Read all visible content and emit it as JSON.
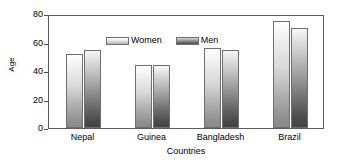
{
  "chart_data": {
    "type": "bar",
    "title": "",
    "xlabel": "Countries",
    "ylabel": "Age",
    "categories": [
      "Nepal",
      "Guinea",
      "Bangladesh",
      "Brazil"
    ],
    "series": [
      {
        "name": "Women",
        "values": [
          52,
          44,
          56,
          75
        ]
      },
      {
        "name": "Men",
        "values": [
          55,
          44,
          55,
          70
        ]
      }
    ],
    "ylim": [
      0,
      80
    ],
    "yticks": [
      0,
      20,
      40,
      60,
      80
    ],
    "ytick_labels": [
      "0",
      "20",
      "40",
      "60",
      "80"
    ],
    "grid": false,
    "legend_position": "top-left-inside",
    "legend_entries": [
      "Women",
      "Men"
    ],
    "colors": {
      "women_light": "#ffffff",
      "women_dark": "#8a8a8a",
      "men_light": "#f7f7f7",
      "men_dark": "#434343",
      "axis": "#5d5d5d",
      "text": "#000000",
      "background": "#ffffff"
    }
  },
  "axes": {
    "y_title": "Age",
    "x_title": "Countries"
  }
}
